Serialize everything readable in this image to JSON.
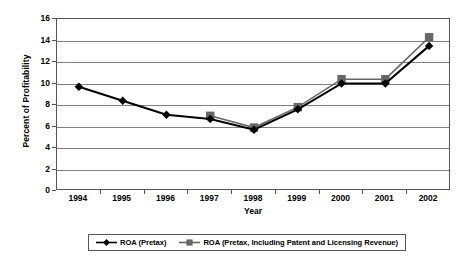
{
  "chart_data": {
    "type": "line",
    "title": "",
    "xlabel": "Year",
    "ylabel": "Percent of Profitability",
    "categories": [
      "1994",
      "1995",
      "1996",
      "1997",
      "1998",
      "1999",
      "2000",
      "2001",
      "2002"
    ],
    "x": [
      1994,
      1995,
      1996,
      1997,
      1998,
      1999,
      2000,
      2001,
      2002
    ],
    "ylim": [
      0,
      16
    ],
    "ytick_labels": [
      "16",
      "14",
      "12",
      "10",
      "8",
      "6",
      "4",
      "2",
      "0"
    ],
    "yticks": [
      16,
      14,
      12,
      10,
      8,
      6,
      4,
      2,
      0
    ],
    "grid": true,
    "legend_position": "bottom",
    "series": [
      {
        "name": "ROA (Pretax)",
        "marker": "diamond",
        "color": "#000000",
        "values": [
          9.7,
          8.4,
          7.1,
          6.7,
          5.7,
          7.6,
          10.0,
          10.0,
          13.5
        ]
      },
      {
        "name": "ROA (Pretax, Including Patent and Licensing Revenue)",
        "marker": "square",
        "color": "#666666",
        "values": [
          null,
          null,
          null,
          7.0,
          5.9,
          7.8,
          10.4,
          10.4,
          14.3
        ]
      }
    ]
  },
  "axes": {
    "y_title": "Percent of Profitability",
    "x_title": "Year"
  },
  "legend": {
    "items": [
      {
        "label": "ROA (Pretax)",
        "marker": "diamond-line-marker",
        "color": "#000000"
      },
      {
        "label": "ROA (Pretax, Including Patent and Licensing Revenue)",
        "marker": "square-line-marker",
        "color": "#666666"
      }
    ]
  }
}
